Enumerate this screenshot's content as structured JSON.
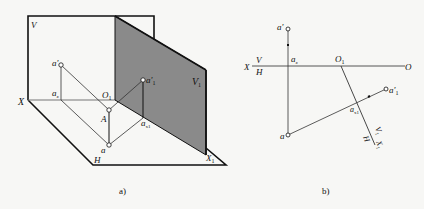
{
  "figure_a": {
    "caption": "a)",
    "labels": {
      "V": "V",
      "V1": "V",
      "V1_sub": "1",
      "X": "X",
      "X1": "X",
      "X1_sub": "1",
      "H": "H",
      "O1": "O",
      "O1_sub": "1",
      "a_prime": "a'",
      "a1_prime": "a'",
      "a1_sub": "1",
      "ax": "a",
      "ax_sub": "x",
      "ax1": "a",
      "ax1_sub": "x1",
      "A": "A",
      "a": "a"
    },
    "plane_fill": "#8a8a8a"
  },
  "figure_b": {
    "caption": "b)",
    "labels": {
      "X": "X",
      "V": "V",
      "H": "H",
      "O": "O",
      "O1": "O",
      "O1_sub": "1",
      "a_prime": "a'",
      "ax": "a",
      "ax_sub": "x",
      "a": "a",
      "a1_prime": "a'",
      "a1_sub": "1",
      "ax1": "a",
      "ax1_sub": "x1",
      "V1": "V",
      "V1_sub": "1",
      "H1": "H",
      "X1": "X",
      "X1_sub": "1"
    }
  }
}
